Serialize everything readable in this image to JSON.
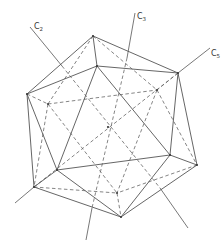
{
  "figure": {
    "colors": {
      "line": "#555555",
      "hidden_line": "#666666",
      "background": "#ffffff"
    }
  },
  "axes": [
    {
      "id": "c2",
      "label": "C",
      "subscript": "2",
      "x": 31,
      "y": 25
    },
    {
      "id": "c3",
      "label": "C",
      "subscript": "3",
      "x": 137,
      "y": 15
    },
    {
      "id": "c5",
      "label": "C",
      "subscript": "5",
      "x": 210,
      "y": 52
    }
  ],
  "vertices": {
    "T": [
      93,
      36
    ],
    "F1": [
      97,
      66
    ],
    "R": [
      178,
      73
    ],
    "L": [
      27,
      94
    ],
    "BL": [
      48,
      104
    ],
    "BR": [
      157,
      90
    ],
    "C": [
      108,
      127
    ],
    "FL": [
      57,
      170
    ],
    "FR": [
      170,
      155
    ],
    "RR": [
      197,
      165
    ],
    "LL": [
      34,
      187
    ],
    "BM": [
      117,
      193
    ],
    "B": [
      121,
      217
    ]
  }
}
